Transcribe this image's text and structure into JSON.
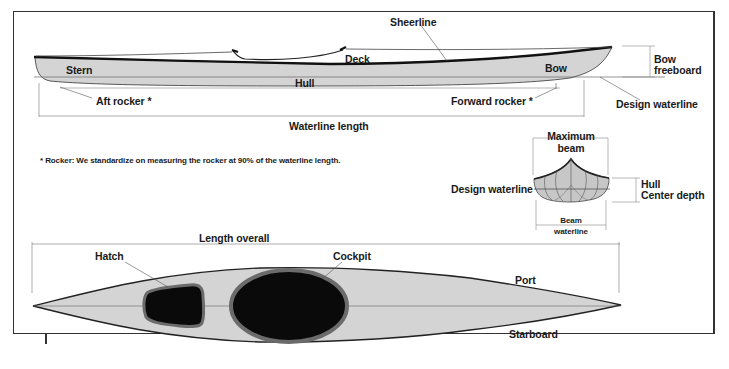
{
  "side_view": {
    "labels": {
      "sheerline": "Sheerline",
      "deck": "Deck",
      "stern": "Stern",
      "hull": "Hull",
      "bow": "Bow",
      "bow_freeboard_line1": "Bow",
      "bow_freeboard_line2": "freeboard",
      "aft_rocker": "Aft rocker *",
      "forward_rocker": "Forward rocker *",
      "design_waterline": "Design waterline",
      "waterline_length": "Waterline length"
    }
  },
  "footnote": "* Rocker: We standardize on measuring the rocker at 90% of the waterline length.",
  "cross_section": {
    "labels": {
      "maximum_beam_line1": "Maximum",
      "maximum_beam_line2": "beam",
      "design_waterline": "Design waterline",
      "hull_center_depth_line1": "Hull",
      "hull_center_depth_line2": "Center depth",
      "beam_waterline_line1": "Beam",
      "beam_waterline_line2": "waterline"
    }
  },
  "top_view": {
    "labels": {
      "length_overall": "Length overall",
      "hatch": "Hatch",
      "cockpit": "Cockpit",
      "port": "Port",
      "starboard": "Starboard"
    }
  },
  "colors": {
    "hull_fill": "#d4d4d4",
    "outline": "#222222",
    "opening_fill": "#0a0a0a",
    "coaming": "#6b6b6b",
    "leader_line": "#555555"
  }
}
